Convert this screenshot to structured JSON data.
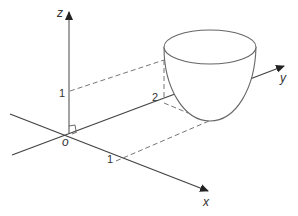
{
  "diagram": {
    "type": "3d-axes-with-paraboloid",
    "axes": {
      "x": {
        "label": "x",
        "tick_label": "1"
      },
      "y": {
        "label": "y",
        "tick_label": "2"
      },
      "z": {
        "label": "z",
        "tick_label": "1"
      },
      "origin": {
        "label": "o"
      }
    },
    "surface": {
      "name": "paraboloid-bowl",
      "description": "Cup-shaped paraboloid with elliptical rim, vertex near the xy-plane"
    },
    "colors": {
      "line": "#444444",
      "dashed": "#666666",
      "surface": "#777777",
      "background": "#ffffff"
    }
  }
}
